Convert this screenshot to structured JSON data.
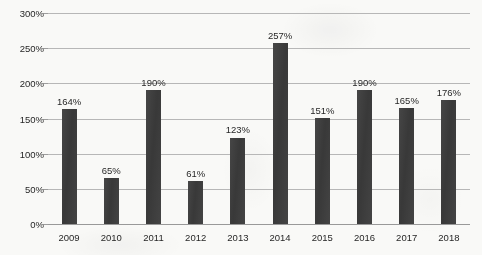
{
  "chart_data": {
    "type": "bar",
    "title": "",
    "subtitle": "",
    "xlabel": "",
    "ylabel": "",
    "categories": [
      "2009",
      "2010",
      "2011",
      "2012",
      "2013",
      "2014",
      "2015",
      "2016",
      "2017",
      "2018"
    ],
    "values": [
      164,
      65,
      190,
      61,
      123,
      257,
      151,
      190,
      165,
      176
    ],
    "data_labels": [
      "164%",
      "65%",
      "190%",
      "61%",
      "123%",
      "257%",
      "151%",
      "190%",
      "165%",
      "176%"
    ],
    "ylim": [
      0,
      300
    ],
    "ytick_values": [
      0,
      50,
      100,
      150,
      200,
      250,
      300
    ],
    "ytick_labels": [
      "0%",
      "50%",
      "100%",
      "150%",
      "200%",
      "250%",
      "300%"
    ],
    "grid": true,
    "legend": false,
    "legend_position": "none",
    "series": [
      {
        "name": "",
        "values": [
          164,
          65,
          190,
          61,
          123,
          257,
          151,
          190,
          165,
          176
        ]
      }
    ],
    "colors": {
      "bar": "#3a3a3a",
      "gridline": "#b9b9b9",
      "axis": "#9a9a9a",
      "text": "#242424",
      "background": "#fdfdfb"
    }
  }
}
